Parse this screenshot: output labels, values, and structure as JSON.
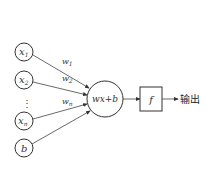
{
  "diagram": {
    "type": "perceptron",
    "inputs": [
      {
        "label": "x",
        "sub": "1"
      },
      {
        "label": "x",
        "sub": "2"
      },
      {
        "label": "x",
        "sub": "n"
      },
      {
        "label": "b",
        "sub": ""
      }
    ],
    "ellipsis": "⋮",
    "weights": [
      {
        "label": "w",
        "sub": "1"
      },
      {
        "label": "w",
        "sub": "2"
      },
      {
        "label": "w",
        "sub": "n"
      }
    ],
    "sum_node": "wx+b",
    "activation": "f",
    "output_label": "输出",
    "colors": {
      "stroke": "#333333",
      "background": "#ffffff"
    }
  }
}
